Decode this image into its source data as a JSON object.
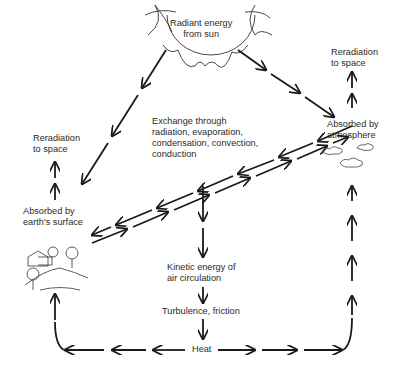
{
  "diagram": {
    "type": "energy-flow",
    "nodes": {
      "sun": {
        "line1": "Radiant energy",
        "line2": "from sun"
      },
      "reradiation_right": {
        "line1": "Reradiation",
        "line2": "to space"
      },
      "reradiation_left": {
        "line1": "Reradiation",
        "line2": "to space"
      },
      "atmosphere": {
        "line1": "Absorbed by",
        "line2": "atmosphere"
      },
      "surface": {
        "line1": "Absorbed by",
        "line2": "earth's surface"
      },
      "exchange": {
        "line1": "Exchange through",
        "line2": "radiation, evaporation,",
        "line3": "condensation, convection,",
        "line4": "conduction"
      },
      "kinetic": {
        "line1": "Kinetic energy of",
        "line2": "air circulation"
      },
      "turbulence": {
        "label": "Turbulence, friction"
      },
      "heat": {
        "label": "Heat"
      }
    },
    "edges": [
      {
        "from": "sun",
        "to": "surface"
      },
      {
        "from": "sun",
        "to": "atmosphere"
      },
      {
        "from": "surface",
        "to": "reradiation_left"
      },
      {
        "from": "atmosphere",
        "to": "reradiation_right"
      },
      {
        "from": "surface",
        "to": "atmosphere",
        "bidirectional": true
      },
      {
        "from": "exchange",
        "to": "kinetic"
      },
      {
        "from": "kinetic",
        "to": "turbulence"
      },
      {
        "from": "turbulence",
        "to": "heat"
      },
      {
        "from": "heat",
        "to": "surface"
      },
      {
        "from": "heat",
        "to": "atmosphere"
      }
    ],
    "colors": {
      "line": "#1a1a1a",
      "background": "#ffffff"
    }
  }
}
